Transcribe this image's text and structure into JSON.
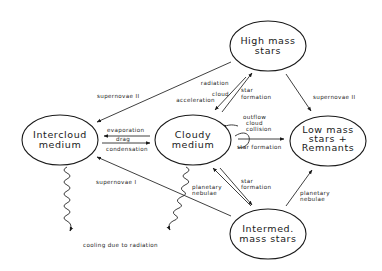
{
  "nodes": {
    "high_mass": {
      "line1": "High mass",
      "line2": "stars"
    },
    "intercloud": {
      "line1": "Intercloud",
      "line2": "medium"
    },
    "cloudy": {
      "line1": "Cloudy",
      "line2": "medium"
    },
    "low_mass": {
      "line1": "Low mass",
      "line2": "stars +",
      "line3": "Remnants"
    },
    "intermed": {
      "line1": "Intermed.",
      "line2": "mass stars"
    }
  },
  "edges": {
    "high_to_intercloud": "supernovae II",
    "high_to_cloudy_line1": "radiation",
    "high_to_cloudy_line2": "cloud",
    "high_to_cloudy_line3": "acceleration",
    "cloudy_to_high_line1": "star",
    "cloudy_to_high_line2": "formation",
    "high_to_low": "supernovae II",
    "cloudy_self_line1": "outflow",
    "cloudy_self_line2": "cloud",
    "cloudy_self_line3": "collision",
    "cloudy_to_intercloud": "evaporation",
    "drag": "drag",
    "intercloud_to_cloudy": "condensation",
    "cloudy_to_low": "star formation",
    "intermed_to_intercloud": "supernovae I",
    "intermed_to_cloudy_line1": "planetary",
    "intermed_to_cloudy_line2": "nebulae",
    "cloudy_to_intermed_line1": "star",
    "cloudy_to_intermed_line2": "formation",
    "intermed_to_low_line1": "planetary",
    "intermed_to_low_line2": "nebulae",
    "cooling": "cooling due to radiation"
  }
}
